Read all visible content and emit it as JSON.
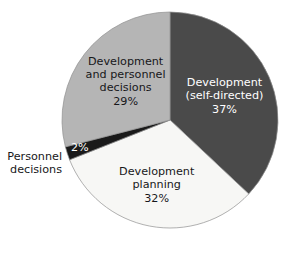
{
  "chart_data": {
    "type": "pie",
    "title": "",
    "subtitle": "",
    "xlabel": "",
    "ylabel": "",
    "legend_position": "none",
    "grid": false,
    "start_angle_deg": 0,
    "direction": "clockwise",
    "categories": [
      "Development (self-directed)",
      "Development planning",
      "Personnel decisions",
      "Development and personnel decisions"
    ],
    "values": [
      37,
      32,
      2,
      29
    ],
    "value_unit": "%",
    "slices": [
      {
        "id": "development-self-directed",
        "label_lines": [
          "Development",
          "(self-directed)"
        ],
        "percent_text": "37%",
        "value": 37,
        "color": "#4a4a4a",
        "text_color": "#ffffff",
        "label_placement": "inside"
      },
      {
        "id": "development-planning",
        "label_lines": [
          "Development",
          "planning"
        ],
        "percent_text": "32%",
        "value": 32,
        "color": "#f7f7f5",
        "text_color": "#17171a",
        "label_placement": "inside"
      },
      {
        "id": "personnel-decisions",
        "label_lines": [
          "Personnel",
          "decisions"
        ],
        "percent_text": "2%",
        "value": 2,
        "color": "#1a1a1a",
        "text_color": "#ffffff",
        "label_placement": "outside-left"
      },
      {
        "id": "development-and-personnel-decisions",
        "label_lines": [
          "Development",
          "and personnel",
          "decisions"
        ],
        "percent_text": "29%",
        "value": 29,
        "color": "#b5b5b5",
        "text_color": "#17171a",
        "label_placement": "inside"
      }
    ]
  },
  "geometry": {
    "center_x": 170,
    "center_y": 120,
    "radius": 108,
    "outline_color": "#8f8f8f"
  },
  "colors": {
    "background": "#ffffff",
    "dark_gray": "#4a4a4a",
    "medium_gray": "#b5b5b5",
    "off_white": "#f7f7f5",
    "black": "#1a1a1a",
    "text_dark": "#17171a",
    "text_light": "#ffffff"
  }
}
